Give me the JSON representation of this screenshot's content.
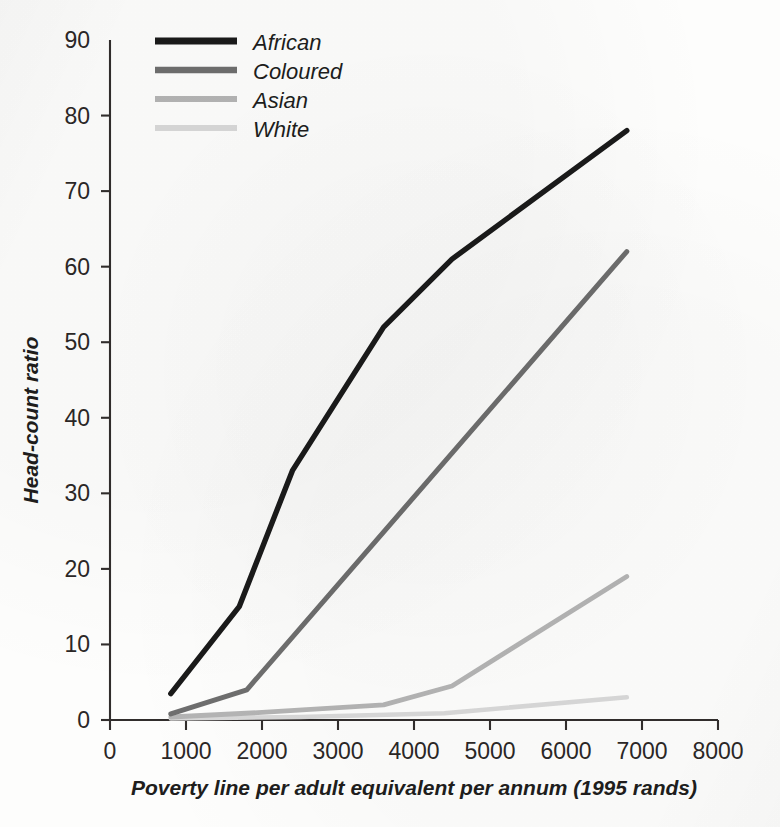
{
  "chart_data": {
    "type": "line",
    "title": "",
    "xlabel": "Poverty line per adult equivalent per annum (1995 rands)",
    "ylabel": "Head-count ratio",
    "xlim": [
      0,
      8000
    ],
    "ylim": [
      0,
      90
    ],
    "xticks": [
      0,
      1000,
      2000,
      3000,
      4000,
      5000,
      6000,
      7000,
      8000
    ],
    "yticks": [
      0,
      10,
      20,
      30,
      40,
      50,
      60,
      70,
      80,
      90
    ],
    "xtick_labels": [
      "0",
      "1000",
      "2000",
      "3000",
      "4000",
      "5000",
      "6000",
      "7000",
      "8000"
    ],
    "ytick_labels": [
      "0",
      "10",
      "20",
      "30",
      "40",
      "50",
      "60",
      "70",
      "80",
      "90"
    ],
    "grid": false,
    "legend_position": "top-left-inside",
    "series": [
      {
        "name": "African",
        "color": "#1a1a1a",
        "width": 5.4,
        "x": [
          800,
          1700,
          2400,
          3600,
          4500,
          6800
        ],
        "y": [
          3.5,
          15.0,
          33.0,
          52.0,
          61.0,
          78.0
        ]
      },
      {
        "name": "Coloured",
        "color": "#6e6e6e",
        "width": 5.0,
        "x": [
          800,
          1800,
          6800
        ],
        "y": [
          0.8,
          4.0,
          62.0
        ]
      },
      {
        "name": "Asian",
        "color": "#b4b4b4",
        "width": 4.8,
        "x": [
          800,
          2000,
          3600,
          4500,
          6800
        ],
        "y": [
          0.4,
          1.0,
          2.0,
          4.5,
          19.0
        ]
      },
      {
        "name": "White",
        "color": "#d8d8d8",
        "width": 4.6,
        "x": [
          800,
          2500,
          4400,
          6800
        ],
        "y": [
          0.2,
          0.4,
          0.9,
          3.0
        ]
      }
    ]
  },
  "legend": {
    "items": [
      {
        "label": "African",
        "color": "#1a1a1a"
      },
      {
        "label": "Coloured",
        "color": "#6e6e6e"
      },
      {
        "label": "Asian",
        "color": "#b4b4b4"
      },
      {
        "label": "White",
        "color": "#d8d8d8"
      }
    ]
  },
  "axes": {
    "x_title": "Poverty line per adult equivalent per annum (1995 rands)",
    "y_title": "Head-count ratio"
  },
  "colors": {
    "axis": "#312d2c",
    "text": "#201d1c",
    "background": "#fdfdfc"
  }
}
